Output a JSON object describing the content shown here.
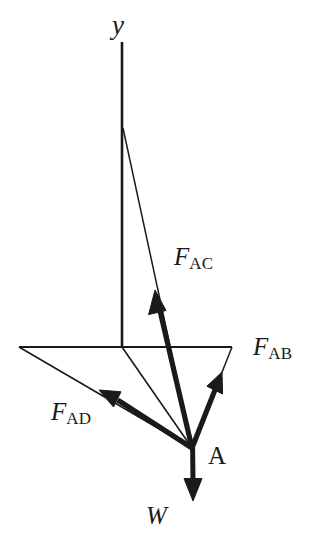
{
  "figure": {
    "background_color": "#ffffff",
    "stroke_color": "#1a1a1a",
    "labels": {
      "axis_y": "y",
      "point_a": "A",
      "weight": "W",
      "force_ac_base": "F",
      "force_ac_sub": "AC",
      "force_ab_base": "F",
      "force_ab_sub": "AB",
      "force_ad_base": "F",
      "force_ad_sub": "AD"
    },
    "geometry": {
      "point_A": [
        192,
        448
      ],
      "axis_y_top": [
        122,
        42
      ],
      "axis_y_bottom": [
        122,
        347
      ],
      "branch_C": [
        123,
        128
      ],
      "plane_left_vertex": [
        19,
        347
      ],
      "plane_right_vertex": [
        232,
        347
      ],
      "arrow_ac_tip": [
        155,
        290
      ],
      "arrow_ab_tip": [
        222,
        372
      ],
      "arrow_ad_tip": [
        99,
        390
      ],
      "arrow_w_tip": [
        193,
        501
      ]
    },
    "elements": [
      {
        "name": "axis-y-line",
        "kind": "thin-line",
        "from": [
          122,
          42
        ],
        "to": [
          122,
          347
        ]
      },
      {
        "name": "plane-horizontal-line",
        "kind": "thin-line",
        "from": [
          19,
          347
        ],
        "to": [
          232,
          347
        ]
      },
      {
        "name": "member-ac-thin-line",
        "kind": "thin-line",
        "from": [
          123,
          128
        ],
        "to": [
          192,
          448
        ]
      },
      {
        "name": "member-ab-thin-line",
        "kind": "thin-line",
        "from": [
          232,
          347
        ],
        "to": [
          192,
          448
        ]
      },
      {
        "name": "member-ao-thin-line",
        "kind": "thin-line",
        "from": [
          122,
          347
        ],
        "to": [
          192,
          448
        ]
      },
      {
        "name": "member-ad-thin-line",
        "kind": "thin-line",
        "from": [
          19,
          347
        ],
        "to": [
          192,
          448
        ]
      },
      {
        "name": "force-ac-arrow",
        "kind": "bold-arrow",
        "from": [
          192,
          448
        ],
        "to": [
          155,
          290
        ]
      },
      {
        "name": "force-ab-arrow",
        "kind": "bold-arrow",
        "from": [
          192,
          448
        ],
        "to": [
          222,
          372
        ]
      },
      {
        "name": "force-ad-arrow",
        "kind": "bold-arrow",
        "from": [
          192,
          448
        ],
        "to": [
          99,
          390
        ]
      },
      {
        "name": "weight-arrow",
        "kind": "bold-arrow",
        "from": [
          192,
          448
        ],
        "to": [
          193,
          501
        ]
      }
    ]
  }
}
